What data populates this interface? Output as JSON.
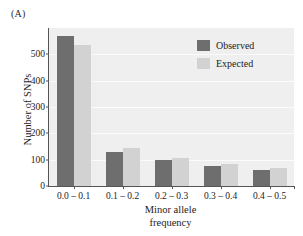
{
  "panel": {
    "label": "(A)"
  },
  "legend": {
    "position": "top-right",
    "entries": [
      {
        "name": "Observed",
        "color": "#6e6e6e"
      },
      {
        "name": "Expected",
        "color": "#d2d2d2"
      }
    ]
  },
  "axes": {
    "ylabel": "Number of SNPs",
    "xlabel_line1": "Minor allele",
    "xlabel_line2": "frequency",
    "yticks": [
      "0",
      "100",
      "200",
      "300",
      "400",
      "500"
    ],
    "ytick_values": [
      0,
      100,
      200,
      300,
      400,
      500
    ],
    "ymin": 0,
    "ymax": 600
  },
  "colors": {
    "observed": "#6e6e6e",
    "expected": "#d2d2d2",
    "plot_background": "#efefef",
    "gridline": "#fbfbfb",
    "axis": "#555555",
    "text": "#1c1c1c"
  },
  "chart_data": {
    "type": "bar",
    "title": "",
    "subtitle": "",
    "xlabel": "Minor allele frequency",
    "ylabel": "Number of SNPs",
    "categories": [
      "0.0 – 0.1",
      "0.1 – 0.2",
      "0.2 – 0.3",
      "0.3 – 0.4",
      "0.4 – 0.5"
    ],
    "series": [
      {
        "name": "Observed",
        "color": "#6e6e6e",
        "values": [
          570,
          130,
          97,
          77,
          60
        ]
      },
      {
        "name": "Expected",
        "color": "#d2d2d2",
        "values": [
          535,
          143,
          105,
          82,
          70
        ]
      }
    ],
    "ylim": [
      0,
      600
    ],
    "yticks": [
      0,
      100,
      200,
      300,
      400,
      500
    ],
    "grid": true,
    "legend_position": "top-right",
    "annotations": [
      "(A)"
    ]
  }
}
